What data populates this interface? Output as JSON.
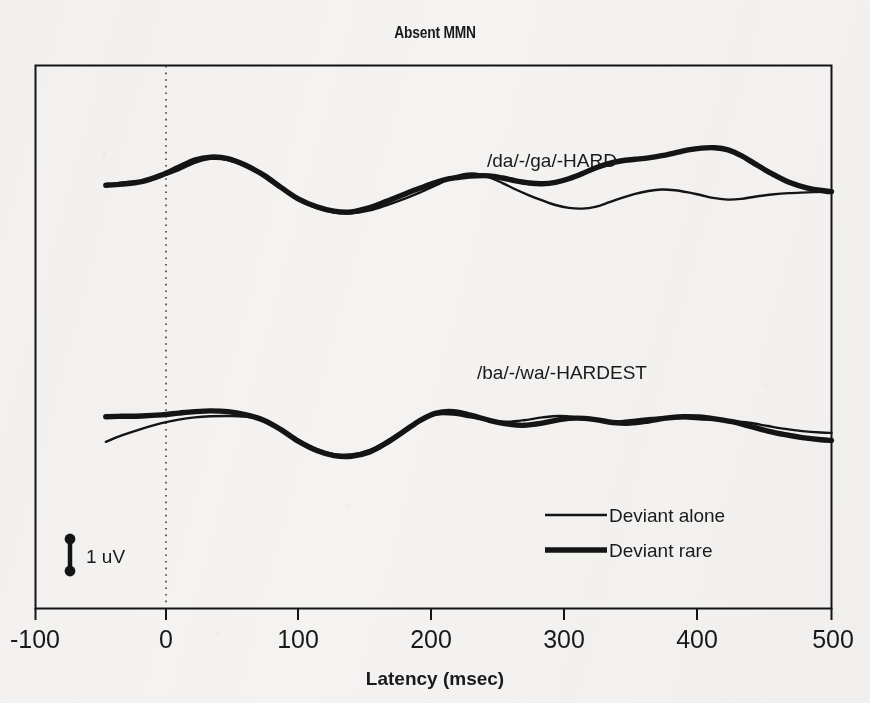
{
  "figure": {
    "title": "Absent MMN",
    "background_color": "#f4f3f1",
    "ink_color": "#141414"
  },
  "scale_bar": {
    "label": "1 uV",
    "name": "amplitude-scale-bar"
  },
  "legend": {
    "position": "inside-bottom-right",
    "entries": [
      {
        "label": "Deviant alone",
        "style": "thin",
        "line_width": 2.2
      },
      {
        "label": "Deviant rare",
        "style": "thick",
        "line_width": 5.2
      }
    ]
  },
  "chart_data": {
    "type": "line",
    "title": "Absent MMN",
    "subtitle": "",
    "xlabel": "Latency (msec)",
    "ylabel": "",
    "xlim": [
      -100,
      500
    ],
    "ylim_note": "Amplitude in microvolts; no y-axis drawn, vertical 1 uV scale bar shown instead",
    "xticks": [
      -100,
      0,
      100,
      200,
      300,
      400,
      500
    ],
    "xticklabels": [
      "-100",
      "0",
      "100",
      "200",
      "300",
      "400",
      "500"
    ],
    "grid": false,
    "zero_line": {
      "x": 0,
      "style": "dotted",
      "label": "stimulus onset"
    },
    "legend": [
      "Deviant alone",
      "Deviant rare"
    ],
    "annotations": [
      {
        "text": "/da/-/ga/-HARD",
        "x": 255,
        "y_px": 160,
        "panel": "upper"
      },
      {
        "text": "/ba/-/wa/-HARDEST",
        "x": 245,
        "y_px": 372,
        "panel": "lower"
      }
    ],
    "panels": [
      {
        "name": "/da/-/ga/-HARD",
        "series": [
          {
            "name": "Deviant alone",
            "style": "thin",
            "x": [
              -47,
              -35,
              -20,
              -5,
              8,
              20,
              32,
              45,
              58,
              72,
              85,
              98,
              112,
              125,
              138,
              152,
              165,
              178,
              190,
              202,
              212,
              222,
              232,
              242,
              252,
              262,
              272,
              282,
              292,
              302,
              312,
              322,
              332,
              342,
              352,
              362,
              372,
              382,
              392,
              402,
              412,
              422,
              432,
              442,
              455,
              468,
              482,
              495,
              500
            ],
            "y_uv": [
              0.3,
              0.37,
              0.42,
              0.55,
              0.72,
              0.92,
              1.03,
              1.0,
              0.83,
              0.55,
              0.22,
              -0.1,
              -0.34,
              -0.46,
              -0.48,
              -0.4,
              -0.25,
              -0.08,
              0.1,
              0.3,
              0.48,
              0.6,
              0.62,
              0.52,
              0.36,
              0.18,
              0.02,
              -0.12,
              -0.25,
              -0.33,
              -0.35,
              -0.3,
              -0.18,
              -0.05,
              0.06,
              0.14,
              0.18,
              0.16,
              0.1,
              0.02,
              -0.06,
              -0.1,
              -0.08,
              -0.02,
              0.04,
              0.08,
              0.1,
              0.12,
              0.12
            ]
          },
          {
            "name": "Deviant rare",
            "style": "thick",
            "x": [
              -47,
              -35,
              -20,
              -5,
              8,
              20,
              32,
              45,
              58,
              72,
              85,
              98,
              112,
              125,
              138,
              152,
              165,
              178,
              190,
              202,
              212,
              222,
              232,
              242,
              252,
              262,
              272,
              282,
              292,
              302,
              312,
              322,
              332,
              342,
              352,
              362,
              372,
              382,
              392,
              402,
              412,
              422,
              432,
              442,
              455,
              468,
              482,
              495,
              500
            ],
            "y_uv": [
              0.3,
              0.33,
              0.4,
              0.58,
              0.8,
              1.0,
              1.08,
              1.04,
              0.86,
              0.58,
              0.24,
              -0.08,
              -0.3,
              -0.42,
              -0.44,
              -0.32,
              -0.14,
              0.05,
              0.22,
              0.38,
              0.48,
              0.53,
              0.56,
              0.56,
              0.5,
              0.42,
              0.36,
              0.34,
              0.38,
              0.48,
              0.62,
              0.78,
              0.9,
              0.98,
              1.02,
              1.06,
              1.12,
              1.2,
              1.28,
              1.33,
              1.34,
              1.28,
              1.12,
              0.9,
              0.62,
              0.38,
              0.22,
              0.14,
              0.12
            ]
          }
        ]
      },
      {
        "name": "/ba/-/wa/-HARDEST",
        "series": [
          {
            "name": "Deviant alone",
            "style": "thin",
            "x": [
              -47,
              -35,
              -20,
              -5,
              8,
              20,
              32,
              45,
              58,
              72,
              85,
              98,
              112,
              125,
              138,
              152,
              165,
              178,
              190,
              202,
              215,
              228,
              242,
              255,
              268,
              282,
              295,
              308,
              322,
              335,
              348,
              362,
              375,
              388,
              400,
              412,
              425,
              438,
              452,
              465,
              478,
              492,
              500
            ],
            "y_uv": [
              -0.58,
              -0.4,
              -0.22,
              -0.06,
              0.04,
              0.1,
              0.13,
              0.14,
              0.12,
              0.02,
              -0.22,
              -0.52,
              -0.78,
              -0.92,
              -0.93,
              -0.8,
              -0.55,
              -0.24,
              0.04,
              0.18,
              0.18,
              0.1,
              0.02,
              -0.02,
              0.02,
              0.1,
              0.14,
              0.1,
              0.02,
              -0.02,
              0.02,
              0.08,
              0.1,
              0.08,
              0.05,
              0.03,
              0.0,
              -0.05,
              -0.14,
              -0.22,
              -0.28,
              -0.32,
              -0.33
            ]
          },
          {
            "name": "Deviant rare",
            "style": "thick",
            "x": [
              -47,
              -35,
              -20,
              -5,
              8,
              20,
              32,
              45,
              58,
              72,
              85,
              98,
              112,
              125,
              138,
              152,
              165,
              178,
              190,
              202,
              215,
              228,
              242,
              255,
              268,
              282,
              295,
              308,
              322,
              335,
              348,
              362,
              375,
              388,
              400,
              412,
              425,
              438,
              452,
              465,
              478,
              492,
              500
            ],
            "y_uv": [
              0.12,
              0.13,
              0.14,
              0.17,
              0.22,
              0.26,
              0.28,
              0.26,
              0.18,
              0.02,
              -0.24,
              -0.56,
              -0.82,
              -0.96,
              -0.98,
              -0.86,
              -0.6,
              -0.28,
              0.02,
              0.22,
              0.26,
              0.16,
              0.02,
              -0.08,
              -0.12,
              -0.06,
              0.04,
              0.08,
              0.04,
              -0.04,
              -0.06,
              0.0,
              0.08,
              0.12,
              0.11,
              0.06,
              -0.02,
              -0.14,
              -0.28,
              -0.38,
              -0.46,
              -0.52,
              -0.54
            ]
          }
        ]
      }
    ]
  }
}
